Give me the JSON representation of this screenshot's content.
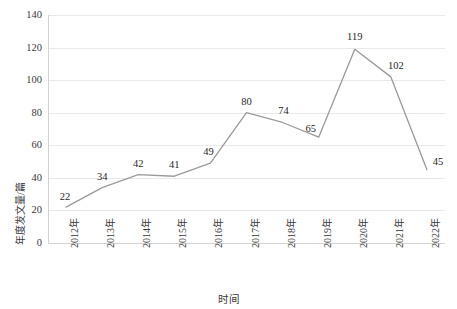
{
  "chart_data": {
    "type": "line",
    "title": "",
    "xlabel": "时间",
    "ylabel": "年度发文量/篇",
    "categories": [
      "2012年",
      "2013年",
      "2014年",
      "2015年",
      "2016年",
      "2017年",
      "2018年",
      "2019年",
      "2020年",
      "2021年",
      "2022年"
    ],
    "values": [
      22,
      34,
      42,
      41,
      49,
      80,
      74,
      65,
      119,
      102,
      45
    ],
    "series": [
      {
        "name": "年度发文量",
        "values": [
          22,
          34,
          42,
          41,
          49,
          80,
          74,
          65,
          119,
          102,
          45
        ]
      }
    ],
    "ylim": [
      0,
      140
    ],
    "yticks": [
      0,
      20,
      40,
      60,
      80,
      100,
      120,
      140
    ],
    "ytick_labels": [
      "0",
      "20",
      "40",
      "60",
      "80",
      "100",
      "120",
      "140"
    ],
    "grid": true,
    "grid_axis": "y",
    "legend": "none",
    "data_labels": [
      "22",
      "34",
      "42",
      "41",
      "49",
      "80",
      "74",
      "65",
      "119",
      "102",
      "45"
    ],
    "line_color": "#9a9a9a",
    "grid_color": "#e9e9e9",
    "text_color": "#3a3a3a",
    "background": "#ffffff",
    "markers": false
  },
  "axis": {
    "y_title": "年度发文量/篇",
    "x_title": "时间"
  }
}
